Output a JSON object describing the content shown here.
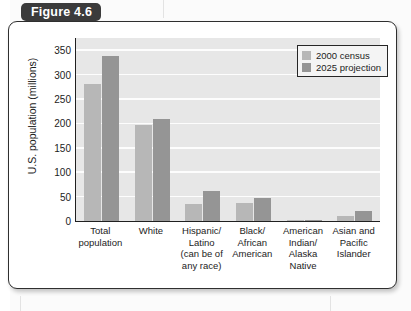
{
  "figure": {
    "tab_label": "Figure 4.6"
  },
  "chart_data": {
    "type": "bar",
    "title": "Figure 4.6",
    "xlabel": "",
    "ylabel": "U.S. population (millions)",
    "ylim": [
      0,
      375
    ],
    "yticks": [
      0,
      50,
      100,
      150,
      200,
      250,
      300,
      350
    ],
    "grid": true,
    "legend_position": "top-right",
    "categories": [
      "Total population",
      "White",
      "Hispanic/ Latino (can be of any race)",
      "Black/ African American",
      "American Indian/ Alaska Native",
      "Asian and Pacific Islander"
    ],
    "category_lines": [
      [
        "Total",
        "population"
      ],
      [
        "White"
      ],
      [
        "Hispanic/",
        "Latino",
        "(can be of",
        "any race)"
      ],
      [
        "Black/",
        "African",
        "American"
      ],
      [
        "American",
        "Indian/",
        "Alaska",
        "Native"
      ],
      [
        "Asian and",
        "Pacific",
        "Islander"
      ]
    ],
    "series": [
      {
        "name": "2000 census",
        "color": "#b7b7b7",
        "values": [
          281,
          196,
          35,
          36,
          2,
          11
        ]
      },
      {
        "name": "2025 projection",
        "color": "#959595",
        "values": [
          338,
          210,
          61,
          47,
          3,
          20
        ]
      }
    ]
  }
}
